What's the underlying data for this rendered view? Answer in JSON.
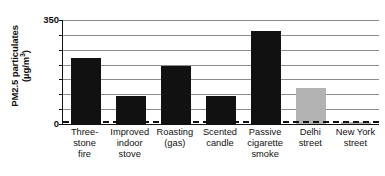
{
  "chart_data": {
    "type": "bar",
    "title": "",
    "subtitle": "",
    "xlabel": "",
    "ylabel": "PM2.5 particulates (µg/m³)",
    "ylabel_line1": "PM2.5 particulates",
    "ylabel_line2": "(µg/m",
    "ylabel_exponent": "3",
    "ylabel_line2_close": ")",
    "ylim": [
      0,
      350
    ],
    "ytick_labels": [
      "0",
      "350"
    ],
    "ytick_values": [
      0,
      350
    ],
    "gridlines": [
      50,
      100,
      150,
      200,
      250,
      300,
      350
    ],
    "grid": true,
    "legend": "none",
    "categories": [
      "Three-stone fire",
      "Improved indoor stove",
      "Roasting (gas)",
      "Scented candle",
      "Passive cigarette smoke",
      "Delhi street",
      "New York street"
    ],
    "category_label_lines": [
      [
        "Three-",
        "stone",
        "fire"
      ],
      [
        "Improved",
        "indoor",
        "stove"
      ],
      [
        "Roasting",
        "(gas)"
      ],
      [
        "Scented",
        "candle"
      ],
      [
        "Passive",
        "cigarette",
        "smoke"
      ],
      [
        "Delhi",
        "street"
      ],
      [
        "New York",
        "street"
      ]
    ],
    "values": [
      222,
      95,
      195,
      93,
      313,
      120,
      8
    ],
    "bar_colors": [
      "#111111",
      "#111111",
      "#111111",
      "#111111",
      "#111111",
      "#b3b3b3",
      "#b3b3b3"
    ],
    "annotations": [
      {
        "name": "guideline-dashed-line",
        "value": 10,
        "style": "dashed",
        "color": "#111111"
      }
    ]
  },
  "colors": {
    "bar_black": "#111111",
    "bar_gray": "#b3b3b3",
    "gridline": "#8d8d8d",
    "axis": "#111111",
    "background": "#ffffff"
  }
}
